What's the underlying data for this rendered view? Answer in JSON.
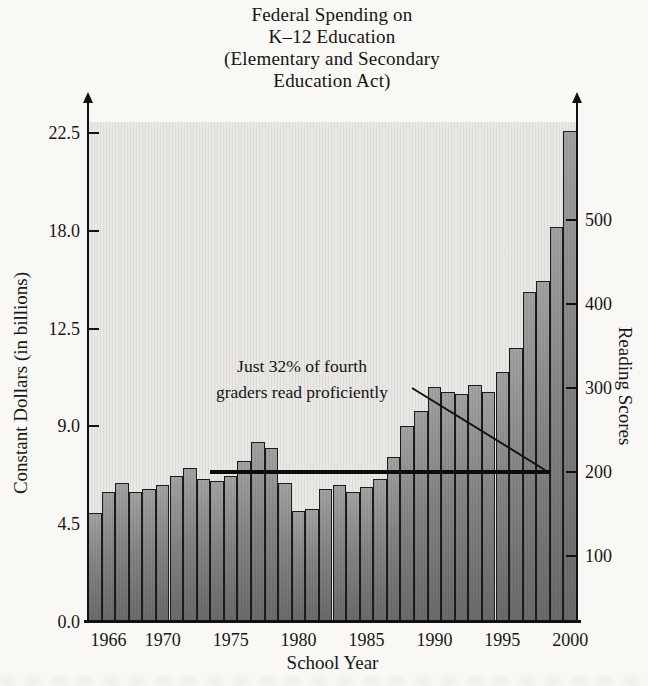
{
  "title": {
    "lines": [
      "Federal Spending on",
      "K–12 Education",
      "(Elementary and Secondary",
      "Education Act)"
    ]
  },
  "left_axis": {
    "label": "Constant Dollars (in billions)",
    "ticks": [
      "22.5",
      "18.0",
      "12.5",
      "9.0",
      "4.5",
      "0.0"
    ]
  },
  "right_axis": {
    "label": "Reading Scores",
    "ticks": [
      "500",
      "400",
      "300",
      "200",
      "100"
    ]
  },
  "x_axis": {
    "label": "School Year",
    "ticks": [
      "1966",
      "1970",
      "1975",
      "1980",
      "1985",
      "1990",
      "1995",
      "2000"
    ]
  },
  "annotation": {
    "lines": [
      "Just 32% of fourth",
      "graders read proficiently"
    ]
  },
  "colors": {
    "bar_fill": "#858585",
    "bar_border": "#1b1b1b",
    "panel_background": "#e9e8e4",
    "axis": "#111111",
    "score_line": "#0c0c0c"
  },
  "chart_data": {
    "type": "bar",
    "title": "Federal Spending on K–12 Education (Elementary and Secondary Education Act)",
    "xlabel": "School Year",
    "ylabel_left": "Constant Dollars (in billions)",
    "ylabel_right": "Reading Scores",
    "x_range": [
      1965,
      2000
    ],
    "x_tick_years": [
      1966,
      1970,
      1975,
      1980,
      1985,
      1990,
      1995,
      2000
    ],
    "left_axis_tick_labels": [
      0.0,
      4.5,
      9.0,
      12.5,
      18.0,
      22.5
    ],
    "right_axis_tick_values": [
      100,
      200,
      300,
      400,
      500
    ],
    "grid": false,
    "legend": "none",
    "series": [
      {
        "name": "Federal spending (constant dollars, billions)",
        "axis": "left",
        "type": "bar",
        "x": [
          1965,
          1966,
          1967,
          1968,
          1969,
          1970,
          1971,
          1972,
          1973,
          1974,
          1975,
          1976,
          1977,
          1978,
          1979,
          1980,
          1981,
          1982,
          1983,
          1984,
          1985,
          1986,
          1987,
          1988,
          1989,
          1990,
          1991,
          1992,
          1993,
          1994,
          1995,
          1996,
          1997,
          1998,
          1999,
          2000
        ],
        "values": [
          5.0,
          6.0,
          6.4,
          6.0,
          6.1,
          6.3,
          6.7,
          7.1,
          6.6,
          6.5,
          6.7,
          7.4,
          8.3,
          8.0,
          6.4,
          5.1,
          5.2,
          6.1,
          6.3,
          6.0,
          6.2,
          6.6,
          7.6,
          9.0,
          9.7,
          10.8,
          10.6,
          10.5,
          10.9,
          10.6,
          11.5,
          12.6,
          15.2,
          15.7,
          18.2,
          22.6
        ]
      },
      {
        "name": "Reading scores (flat line)",
        "axis": "right",
        "type": "line",
        "from_year": 1974,
        "to_year": 1999,
        "value": 200
      }
    ],
    "annotation": "Just 32% of fourth graders read proficiently"
  }
}
